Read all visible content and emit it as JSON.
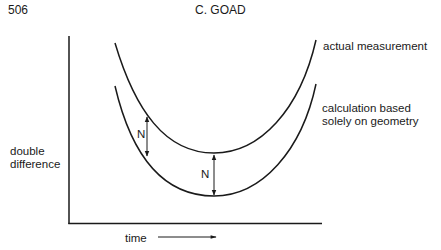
{
  "header": {
    "page_number": "506",
    "author": "C. GOAD"
  },
  "figure": {
    "y_axis_label_line1": "double",
    "y_axis_label_line2": "difference",
    "x_axis_label": "time",
    "curves": [
      {
        "name": "actual measurement",
        "label": "actual measurement"
      },
      {
        "name": "calculation",
        "label_line1": "calculation based",
        "label_line2": "solely on geometry"
      }
    ],
    "offset_markers": [
      {
        "label": "N"
      },
      {
        "label": "N"
      }
    ],
    "ink_color": "#1a1a1a"
  }
}
